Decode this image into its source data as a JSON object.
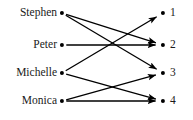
{
  "diagram": {
    "type": "bipartite-graph",
    "title": "",
    "geometry": {
      "width": 193,
      "height": 120,
      "left_column_x": 62,
      "right_column_x": 163,
      "row_y": [
        13,
        45,
        73,
        101
      ]
    },
    "left_nodes": [
      {
        "id": "stephen",
        "label": "Stephen",
        "x": 62,
        "y": 13,
        "label_x": 57,
        "label_y": 13
      },
      {
        "id": "peter",
        "label": "Peter",
        "x": 62,
        "y": 45,
        "label_x": 57,
        "label_y": 45
      },
      {
        "id": "michelle",
        "label": "Michelle",
        "x": 62,
        "y": 73,
        "label_x": 57,
        "label_y": 73
      },
      {
        "id": "monica",
        "label": "Monica",
        "x": 62,
        "y": 101,
        "label_x": 57,
        "label_y": 101
      }
    ],
    "right_nodes": [
      {
        "id": "n1",
        "label": "1",
        "x": 163,
        "y": 13,
        "label_x": 170,
        "label_y": 13
      },
      {
        "id": "n2",
        "label": "2",
        "x": 163,
        "y": 45,
        "label_x": 170,
        "label_y": 45
      },
      {
        "id": "n3",
        "label": "3",
        "x": 163,
        "y": 73,
        "label_x": 170,
        "label_y": 73
      },
      {
        "id": "n4",
        "label": "4",
        "x": 163,
        "y": 101,
        "label_x": 170,
        "label_y": 101
      }
    ],
    "edges": [
      {
        "from": "stephen",
        "to": "n2",
        "x1": 62,
        "y1": 13,
        "x2": 163,
        "y2": 45
      },
      {
        "from": "stephen",
        "to": "n3",
        "x1": 62,
        "y1": 13,
        "x2": 163,
        "y2": 73
      },
      {
        "from": "peter",
        "to": "n2",
        "x1": 62,
        "y1": 45,
        "x2": 163,
        "y2": 45
      },
      {
        "from": "michelle",
        "to": "n1",
        "x1": 62,
        "y1": 73,
        "x2": 163,
        "y2": 13
      },
      {
        "from": "michelle",
        "to": "n4",
        "x1": 62,
        "y1": 73,
        "x2": 163,
        "y2": 101
      },
      {
        "from": "monica",
        "to": "n3",
        "x1": 62,
        "y1": 101,
        "x2": 163,
        "y2": 73
      },
      {
        "from": "monica",
        "to": "n4",
        "x1": 62,
        "y1": 101,
        "x2": 163,
        "y2": 101
      }
    ],
    "style": {
      "edge_color": "#000000",
      "edge_width": 1.3,
      "node_color": "#000000",
      "text_color": "#1a1a1a",
      "background": "#ffffff",
      "arrowhead": "filled-triangle"
    }
  }
}
